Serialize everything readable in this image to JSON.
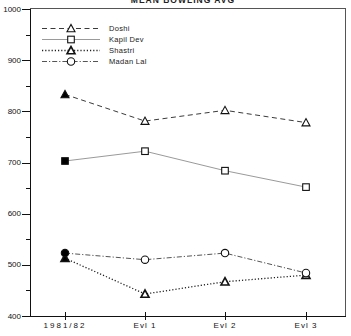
{
  "header": {
    "title": "MEAN BOWLING AVG"
  },
  "chart_data": {
    "type": "line",
    "title": "MEAN BOWLING AVG",
    "categories": [
      "1981/82",
      "Evl 1",
      "Evl 2",
      "Evl 3"
    ],
    "series": [
      {
        "name": "Doshi",
        "values": [
          833,
          781,
          802,
          778
        ],
        "marker": "triangle",
        "marker_weight": "normal",
        "line": "dashed",
        "color": "#3a3a3a",
        "first_point_filled": true
      },
      {
        "name": "Kapil Dev",
        "values": [
          703,
          722,
          684,
          652
        ],
        "marker": "square",
        "marker_weight": "normal",
        "line": "solid",
        "color": "#9a9a9a",
        "first_point_filled": true
      },
      {
        "name": "Shastri",
        "values": [
          513,
          443,
          467,
          480
        ],
        "marker": "triangle",
        "marker_weight": "bold",
        "line": "dotted",
        "color": "#1f1f1f",
        "first_point_filled": true
      },
      {
        "name": "Madan Lal",
        "values": [
          523,
          510,
          523,
          484
        ],
        "marker": "circle",
        "marker_weight": "normal",
        "line": "dashdot",
        "color": "#555555",
        "first_point_filled": true
      }
    ],
    "ylim": [
      400,
      1000
    ],
    "yticks": [
      1000,
      900,
      800,
      700,
      600,
      500,
      400
    ],
    "y_minor_step": 50,
    "xlabel": "",
    "ylabel": "",
    "grid": false,
    "legend_position": "top-left",
    "axis_color": "#111111",
    "marker_stroke": "#111111",
    "background": "#ffffff"
  }
}
